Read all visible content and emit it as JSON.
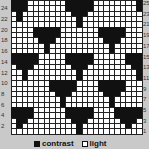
{
  "chart_data": {
    "type": "heatmap",
    "title": "",
    "columns": 24,
    "rows": 25,
    "row_labels_left": [
      "24",
      "22",
      "20",
      "18",
      "16",
      "14",
      "12",
      "10",
      "8",
      "6",
      "4",
      "2"
    ],
    "row_labels_right": [
      "25",
      "23",
      "21",
      "19",
      "17",
      "15",
      "13",
      "11",
      "9",
      "7",
      "5",
      "3",
      "1"
    ],
    "legend": [
      {
        "name": "contrast",
        "color": "#111111"
      },
      {
        "name": "light",
        "color": "#ffffff"
      }
    ],
    "grid": [
      "111000000011111000000001",
      "111000000011111000000001",
      "010000000001110000000000",
      "010000000000100000000000",
      "000000000000100000000000",
      "000011111000000011111000",
      "000011111000000011111000",
      "000001110000000001110000",
      "000000100000000000100000",
      "000000100000000000100000",
      "111110000011111000000111",
      "111110000011111000000111",
      "011100000001110000000011",
      "001000000000100000000001",
      "001000000000100000000001",
      "000000011111000011111000",
      "000000011111000011111000",
      "000000001110000001110000",
      "000000000100000000100000",
      "000000000100000000100000",
      "111100000011111000011111",
      "111100000011111000011111",
      "011000000001110000001110",
      "010000000000100000000100",
      "000000000000100000000000"
    ]
  },
  "legend": {
    "contrast": "contrast",
    "light": "light"
  }
}
